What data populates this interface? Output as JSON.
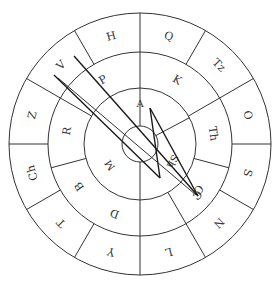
{
  "diagram": {
    "title": "",
    "center": {
      "x": 140,
      "y": 144
    },
    "radii": {
      "outer": 131,
      "middle": 92,
      "inner": 56,
      "core": 18
    },
    "outer_ring": {
      "sector_count": 12,
      "labels": [
        "Q",
        "Tz",
        "O",
        "S",
        "N",
        "L",
        "Y",
        "T",
        "Ch",
        "Z",
        "V",
        "H"
      ]
    },
    "middle_ring": {
      "sector_count": 8,
      "labels": [
        "K",
        "Th",
        "C",
        "",
        "D",
        "B",
        "R",
        "P"
      ]
    },
    "inner_ring": {
      "sector_count": 4,
      "labels": [
        "A",
        "Sh",
        "",
        "M"
      ]
    },
    "traces": [
      {
        "from": [
          74,
          56
        ],
        "to": [
          198,
          196
        ]
      },
      {
        "from": [
          54,
          75
        ],
        "to": [
          160,
          178
        ]
      },
      {
        "from": [
          58,
          78
        ],
        "to": [
          196,
          195
        ]
      },
      {
        "from": [
          160,
          178
        ],
        "to": [
          150,
          108
        ]
      },
      {
        "from": [
          150,
          108
        ],
        "to": [
          198,
          196
        ]
      }
    ],
    "end_marker": {
      "x": 197,
      "y": 195,
      "label": "C"
    }
  }
}
